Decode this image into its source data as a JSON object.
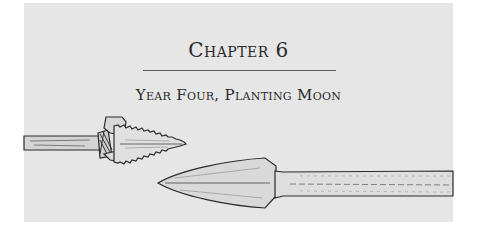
{
  "chapter": {
    "title": "Chapter 6",
    "subtitle": "Year Four, Planting Moon"
  },
  "illustration": {
    "description": "Two crossed spears: a serrated stone spearhead lashed to a wooden shaft on the left, and a leaf-shaped metal spearhead on a long shaft on the right",
    "colors": {
      "background": "#e6e6e6",
      "ink": "#2a2a2a"
    }
  }
}
